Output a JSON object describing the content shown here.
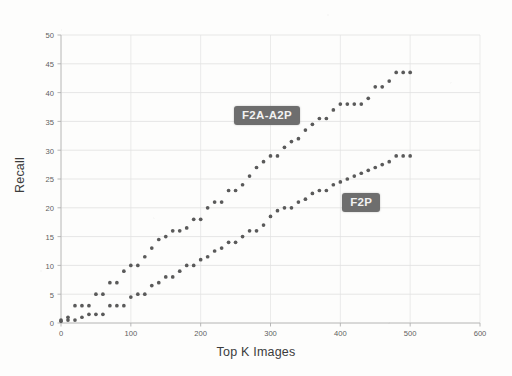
{
  "chart_data": {
    "type": "scatter",
    "title": "",
    "xlabel": "Top K Images",
    "ylabel": "Recall",
    "xlim": [
      0,
      600
    ],
    "ylim": [
      0,
      50
    ],
    "xticks": [
      0,
      100,
      200,
      300,
      400,
      500,
      600
    ],
    "yticks": [
      0,
      5,
      10,
      15,
      20,
      25,
      30,
      35,
      40,
      45,
      50
    ],
    "grid": true,
    "legend_position": "inline-annotation",
    "marker": "circle",
    "marker_color": "#5a5a5a",
    "series": [
      {
        "name": "F2A-A2P",
        "label_color": "#6e6e6e",
        "x": [
          0,
          10,
          20,
          30,
          40,
          50,
          60,
          70,
          80,
          90,
          100,
          110,
          120,
          130,
          140,
          150,
          160,
          170,
          180,
          190,
          200,
          210,
          220,
          230,
          240,
          250,
          260,
          270,
          280,
          290,
          300,
          310,
          320,
          330,
          340,
          350,
          360,
          370,
          380,
          390,
          400,
          410,
          420,
          430,
          440,
          450,
          460,
          470,
          480,
          490,
          500
        ],
        "values": [
          0.5,
          1.0,
          3.0,
          3.0,
          3.0,
          5.0,
          5.0,
          7.0,
          7.0,
          9.0,
          10.0,
          10.0,
          11.5,
          13.0,
          14.5,
          15.0,
          16.0,
          16.0,
          16.5,
          18.0,
          18.0,
          20.0,
          21.0,
          21.0,
          23.0,
          23.0,
          24.0,
          25.5,
          27.0,
          28.0,
          29.0,
          29.0,
          30.5,
          31.5,
          32.0,
          33.5,
          34.5,
          35.5,
          35.5,
          37.0,
          38.0,
          38.0,
          38.0,
          38.0,
          39.0,
          41.0,
          41.0,
          42.0,
          43.5,
          43.5,
          43.5
        ]
      },
      {
        "name": "F2P",
        "label_color": "#6e6e6e",
        "x": [
          0,
          10,
          20,
          30,
          40,
          50,
          60,
          70,
          80,
          90,
          100,
          110,
          120,
          130,
          140,
          150,
          160,
          170,
          180,
          190,
          200,
          210,
          220,
          230,
          240,
          250,
          260,
          270,
          280,
          290,
          300,
          310,
          320,
          330,
          340,
          350,
          360,
          370,
          380,
          390,
          400,
          410,
          420,
          430,
          440,
          450,
          460,
          470,
          480,
          490,
          500
        ],
        "values": [
          0.3,
          0.5,
          0.5,
          1.0,
          1.5,
          1.5,
          1.5,
          3.0,
          3.0,
          3.0,
          4.5,
          5.0,
          5.0,
          6.5,
          7.0,
          8.0,
          8.0,
          9.0,
          10.0,
          10.0,
          11.0,
          11.5,
          12.5,
          13.0,
          14.0,
          14.0,
          15.0,
          16.0,
          16.0,
          17.0,
          18.5,
          19.5,
          20.0,
          20.0,
          21.0,
          21.5,
          22.5,
          23.0,
          23.0,
          24.0,
          24.5,
          25.0,
          25.5,
          26.0,
          26.5,
          27.0,
          27.5,
          28.0,
          29.0,
          29.0,
          29.0
        ]
      }
    ],
    "annotations": [
      {
        "text": "F2A-A2P",
        "x": 295,
        "y": 36
      },
      {
        "text": "F2P",
        "x": 430,
        "y": 21
      }
    ]
  }
}
